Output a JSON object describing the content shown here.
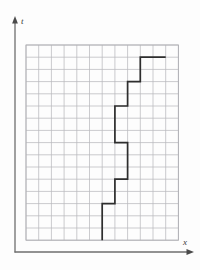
{
  "figure": {
    "title": "",
    "background_color": "#fdfdfd",
    "axis_color": "#6f6f6f",
    "grid_color": "#b9b9bd",
    "grid_minor_color": "#d6d6da",
    "curve_color": "#2e2e2e"
  },
  "axes": {
    "vertical": {
      "label": "t",
      "name": "t-axis",
      "arrow": "arrow-up"
    },
    "horizontal": {
      "label": "x",
      "name": "x-axis",
      "arrow": "arrow-right"
    }
  },
  "grid": {
    "columns": 12,
    "rows": 16,
    "left_px": 26,
    "top_px": 45,
    "cell_width_px": 12.7,
    "cell_height_px": 12.2,
    "show_border": true
  },
  "chart_data": {
    "type": "line",
    "title": "",
    "xlabel": "x",
    "ylabel": "t",
    "grid": true,
    "legend": "none",
    "xlim": [
      0,
      12
    ],
    "ylim": [
      0,
      16
    ],
    "style": "step-staircase",
    "series": [
      {
        "name": "worldline",
        "color": "#2e2e2e",
        "step_points_grid_units": [
          [
            6,
            0
          ],
          [
            6,
            3
          ],
          [
            7,
            3
          ],
          [
            7,
            5
          ],
          [
            8,
            5
          ],
          [
            8,
            8
          ],
          [
            7,
            8
          ],
          [
            7,
            11
          ],
          [
            8,
            11
          ],
          [
            8,
            13
          ],
          [
            9,
            13
          ],
          [
            9,
            15
          ],
          [
            11,
            15
          ]
        ],
        "x": [
          6,
          6,
          7,
          7,
          8,
          8,
          7,
          7,
          8,
          8,
          9,
          9,
          11
        ],
        "y": [
          0,
          3,
          3,
          5,
          5,
          8,
          8,
          11,
          11,
          13,
          13,
          15,
          15
        ]
      }
    ]
  }
}
